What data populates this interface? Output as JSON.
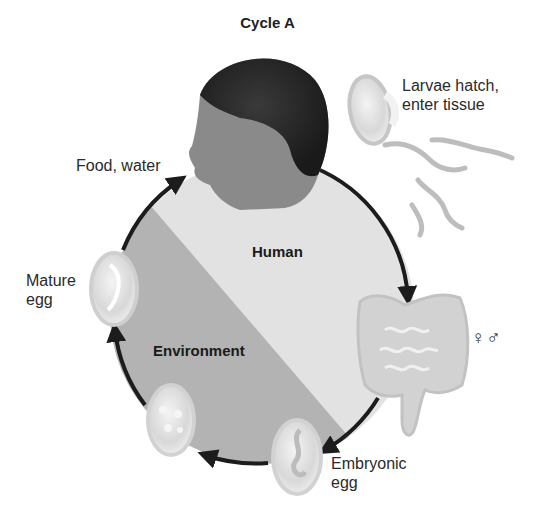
{
  "title": "Cycle A",
  "regions": {
    "human": "Human",
    "environment": "Environment"
  },
  "stages": [
    {
      "id": "food-water",
      "label": "Food, water"
    },
    {
      "id": "larvae",
      "label": "Larvae hatch,\nenter tissue"
    },
    {
      "id": "adults",
      "label": "♀♂"
    },
    {
      "id": "embryonic-egg",
      "label": "Embryonic\negg"
    },
    {
      "id": "mature-egg",
      "label": "Mature\negg"
    }
  ],
  "colors": {
    "human_fill": "#e2e2e2",
    "environment_fill": "#b3b3b3",
    "arrow": "#1c1c1c",
    "text": "#2a2a2a"
  }
}
